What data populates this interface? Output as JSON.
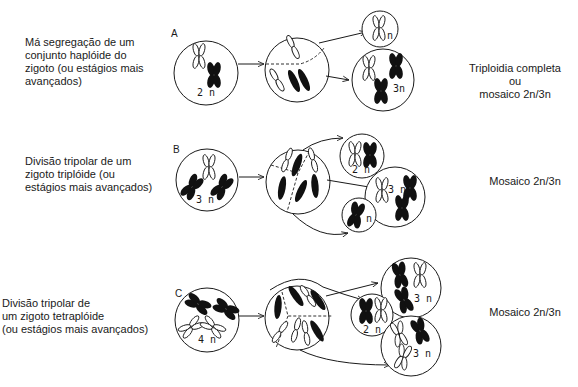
{
  "panels": [
    {
      "id": "A",
      "letter": "A",
      "description": "Má segregação de um\nconjunto haplóide do\nzigoto (ou estágios mais\navançados)",
      "zygote_label": "2 n",
      "daughters": [
        "n",
        "3n"
      ],
      "outcome": "Triploidia completa\nou\nmosaico 2n/3n"
    },
    {
      "id": "B",
      "letter": "B",
      "description": "Divisão tripolar de um\nzigoto triplóide (ou\nestágios mais avançados)",
      "zygote_label": "3 n",
      "daughters": [
        "2 n",
        "3 n",
        "n"
      ],
      "outcome": "Mosaico 2n/3n"
    },
    {
      "id": "C",
      "letter": "C",
      "description": "Divisão tripolar de\num zigoto tetraplóide\n(ou estágios mais avançados)",
      "zygote_label": "4 n",
      "daughters": [
        "3 n",
        "2 n",
        "3 n"
      ],
      "outcome": "Mosaico 2n/3n"
    }
  ],
  "colors": {
    "ink": "#1a1a1a",
    "background": "#ffffff"
  }
}
